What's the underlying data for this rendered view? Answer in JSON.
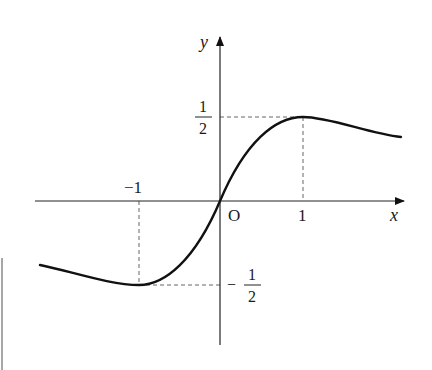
{
  "figure": {
    "axes": {
      "x_label": "x",
      "y_label": "y",
      "origin_label": "O"
    },
    "x_ticks": [
      {
        "label": "-1",
        "value": -1
      },
      {
        "label": "1",
        "value": 1
      }
    ],
    "y_ticks": [
      {
        "label_num": "1",
        "label_den": "2",
        "sign": "",
        "value": 0.5
      },
      {
        "label_num": "1",
        "label_den": "2",
        "sign": "−",
        "value": -0.5
      }
    ],
    "x_tick_labels": {
      "neg_one": "−1",
      "one": "1"
    },
    "y_tick_labels": {
      "half_num": "1",
      "half_den": "2",
      "neg_half_sign": "−",
      "neg_half_num": "1",
      "neg_half_den": "2"
    },
    "key_points": [
      {
        "name": "maximum",
        "x": 1,
        "y": 0.5
      },
      {
        "name": "minimum",
        "x": -1,
        "y": -0.5
      },
      {
        "name": "origin",
        "x": 0,
        "y": 0
      }
    ],
    "colors": {
      "curve": "#111111",
      "axis": "#222222",
      "dashed": "#666666"
    }
  }
}
